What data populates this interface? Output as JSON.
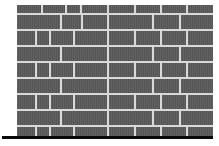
{
  "figure": {
    "canvas": {
      "width": 219,
      "height": 146,
      "background": "#ffffff"
    }
  },
  "colors": {
    "brick": "#595959",
    "mortar": "#d9d9d9",
    "ground": "#0a0a0a",
    "background": "#ffffff"
  },
  "chart_data": {
    "type": "diagram",
    "wall": {
      "x": 17,
      "y": 5,
      "width": 196,
      "height": 131,
      "course_count": 9,
      "mortar_thickness": 2
    },
    "ground_line": {
      "x": 2,
      "y": 136,
      "width": 211,
      "height": 3,
      "color": "#0a0a0a"
    },
    "courses": [
      {
        "index": 0,
        "label": "course-1-top",
        "y": 5,
        "height": 8,
        "bricks": [
          {
            "x": 17,
            "width": 24
          },
          {
            "x": 43,
            "width": 22
          },
          {
            "x": 67,
            "width": 13
          },
          {
            "x": 82,
            "width": 25
          },
          {
            "x": 109,
            "width": 25
          },
          {
            "x": 136,
            "width": 24
          },
          {
            "x": 162,
            "width": 24
          },
          {
            "x": 188,
            "width": 25
          }
        ]
      },
      {
        "index": 1,
        "label": "course-2",
        "y": 15,
        "height": 14,
        "bricks": [
          {
            "x": 17,
            "width": 43
          },
          {
            "x": 62,
            "width": 19
          },
          {
            "x": 83,
            "width": 24
          },
          {
            "x": 109,
            "width": 43
          },
          {
            "x": 154,
            "width": 25
          },
          {
            "x": 181,
            "width": 32
          }
        ]
      },
      {
        "index": 2,
        "label": "course-3",
        "y": 31,
        "height": 14,
        "bricks": [
          {
            "x": 17,
            "width": 18
          },
          {
            "x": 37,
            "width": 12
          },
          {
            "x": 51,
            "width": 22
          },
          {
            "x": 75,
            "width": 32
          },
          {
            "x": 109,
            "width": 25
          },
          {
            "x": 136,
            "width": 24
          },
          {
            "x": 162,
            "width": 24
          },
          {
            "x": 188,
            "width": 25
          }
        ]
      },
      {
        "index": 3,
        "label": "course-4",
        "y": 47,
        "height": 14,
        "bricks": [
          {
            "x": 17,
            "width": 43
          },
          {
            "x": 62,
            "width": 45
          },
          {
            "x": 109,
            "width": 43
          },
          {
            "x": 154,
            "width": 25
          },
          {
            "x": 181,
            "width": 32
          }
        ]
      },
      {
        "index": 4,
        "label": "course-5",
        "y": 63,
        "height": 14,
        "bricks": [
          {
            "x": 17,
            "width": 18
          },
          {
            "x": 37,
            "width": 12
          },
          {
            "x": 51,
            "width": 22
          },
          {
            "x": 75,
            "width": 32
          },
          {
            "x": 109,
            "width": 25
          },
          {
            "x": 136,
            "width": 24
          },
          {
            "x": 162,
            "width": 24
          },
          {
            "x": 188,
            "width": 25
          }
        ]
      },
      {
        "index": 5,
        "label": "course-6",
        "y": 79,
        "height": 14,
        "bricks": [
          {
            "x": 17,
            "width": 43
          },
          {
            "x": 62,
            "width": 45
          },
          {
            "x": 109,
            "width": 43
          },
          {
            "x": 154,
            "width": 25
          },
          {
            "x": 181,
            "width": 32
          }
        ]
      },
      {
        "index": 6,
        "label": "course-7",
        "y": 95,
        "height": 14,
        "bricks": [
          {
            "x": 17,
            "width": 18
          },
          {
            "x": 37,
            "width": 12
          },
          {
            "x": 51,
            "width": 22
          },
          {
            "x": 75,
            "width": 32
          },
          {
            "x": 109,
            "width": 25
          },
          {
            "x": 136,
            "width": 24
          },
          {
            "x": 162,
            "width": 24
          },
          {
            "x": 188,
            "width": 25
          }
        ]
      },
      {
        "index": 7,
        "label": "course-8",
        "y": 111,
        "height": 14,
        "bricks": [
          {
            "x": 17,
            "width": 43
          },
          {
            "x": 62,
            "width": 45
          },
          {
            "x": 109,
            "width": 43
          },
          {
            "x": 154,
            "width": 25
          },
          {
            "x": 181,
            "width": 32
          }
        ]
      },
      {
        "index": 8,
        "label": "course-9-bottom",
        "y": 127,
        "height": 9,
        "bricks": [
          {
            "x": 17,
            "width": 18
          },
          {
            "x": 37,
            "width": 12
          },
          {
            "x": 51,
            "width": 22
          },
          {
            "x": 75,
            "width": 32
          },
          {
            "x": 109,
            "width": 25
          },
          {
            "x": 136,
            "width": 24
          },
          {
            "x": 162,
            "width": 24
          },
          {
            "x": 188,
            "width": 25
          }
        ]
      }
    ]
  }
}
